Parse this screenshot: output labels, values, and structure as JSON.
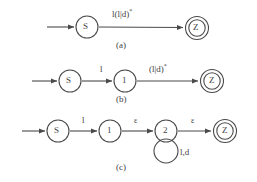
{
  "figure": {
    "type": "finite-automata-sequence",
    "stroke_color": "#4a4a4a",
    "text_color": "#3f3f3f",
    "background": "#ffffff"
  },
  "rows": [
    {
      "caption": "(a)",
      "states": [
        {
          "id": "S",
          "label": "S",
          "kind": "start",
          "cx": 87,
          "cy": 27,
          "r": 11
        },
        {
          "id": "Z",
          "label": "Z",
          "kind": "accept",
          "cx": 197,
          "cy": 28,
          "r": 11
        }
      ],
      "edges": [
        {
          "from": "entry",
          "to": "S",
          "label": ""
        },
        {
          "from": "S",
          "to": "Z",
          "label": "l(l|d)",
          "star": "*"
        }
      ]
    },
    {
      "caption": "(b)",
      "states": [
        {
          "id": "S",
          "label": "S",
          "kind": "start",
          "cx": 70,
          "cy": 81,
          "r": 11
        },
        {
          "id": "1",
          "label": "1",
          "kind": "normal",
          "cx": 125,
          "cy": 81,
          "r": 11
        },
        {
          "id": "Z",
          "label": "Z",
          "kind": "accept",
          "cx": 212,
          "cy": 81,
          "r": 11
        }
      ],
      "edges": [
        {
          "from": "entry",
          "to": "S",
          "label": ""
        },
        {
          "from": "S",
          "to": "1",
          "label": "l",
          "star": ""
        },
        {
          "from": "1",
          "to": "Z",
          "label": "(l|d)",
          "star": "*"
        }
      ]
    },
    {
      "caption": "(c)",
      "states": [
        {
          "id": "S",
          "label": "S",
          "kind": "start",
          "cx": 58,
          "cy": 131,
          "r": 11
        },
        {
          "id": "1",
          "label": "1",
          "kind": "normal",
          "cx": 110,
          "cy": 131,
          "r": 11
        },
        {
          "id": "2",
          "label": "2",
          "kind": "normal",
          "cx": 166,
          "cy": 131,
          "r": 11
        },
        {
          "id": "Z",
          "label": "Z",
          "kind": "accept",
          "cx": 225,
          "cy": 131,
          "r": 11
        }
      ],
      "edges": [
        {
          "from": "entry",
          "to": "S",
          "label": ""
        },
        {
          "from": "S",
          "to": "1",
          "label": "l",
          "star": ""
        },
        {
          "from": "1",
          "to": "2",
          "label": "ε",
          "star": ""
        },
        {
          "from": "2",
          "to": "Z",
          "label": "ε",
          "star": ""
        },
        {
          "from": "2",
          "to": "2",
          "label": "l,d",
          "star": "",
          "self_loop": true
        }
      ]
    }
  ],
  "labels": {
    "a_edge_SZ": "l(l|d)",
    "a_edge_SZ_star": "*",
    "a_caption": "(a)",
    "b_edge_S1": "l",
    "b_edge_1Z": "(l|d)",
    "b_edge_1Z_star": "*",
    "b_caption": "(b)",
    "c_edge_S1": "l",
    "c_edge_12": "ε",
    "c_edge_2Z": "ε",
    "c_loop": "l,d",
    "c_caption": "(c)",
    "state_S": "S",
    "state_1": "1",
    "state_2": "2",
    "state_Z": "Z"
  }
}
